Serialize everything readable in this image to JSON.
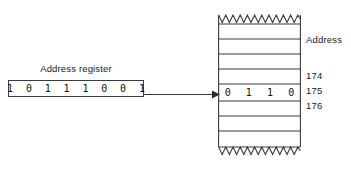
{
  "figure": {
    "kind": "memory-addressing-diagram",
    "width": 351,
    "height": 170,
    "line_color": "#3a3a3a",
    "text_color": "#1a1a1a",
    "background": "#ffffff"
  },
  "register": {
    "label": "Address register",
    "bits": "1 0 1 1 1 0 0 1",
    "bit_count": 8
  },
  "arrow": {
    "name": "pointer-arrow",
    "direction": "right",
    "from": "address-register",
    "to": "memory-cell-175"
  },
  "memory": {
    "header_label": "Address",
    "row_count": 9,
    "highlighted_row_index": 5,
    "cell_value": "0 1 1 0",
    "addresses": [
      {
        "id": "addr-174",
        "label": "174"
      },
      {
        "id": "addr-175",
        "label": "175"
      },
      {
        "id": "addr-176",
        "label": "176"
      }
    ],
    "top_edge": "zigzag",
    "bottom_edge": "zigzag"
  }
}
